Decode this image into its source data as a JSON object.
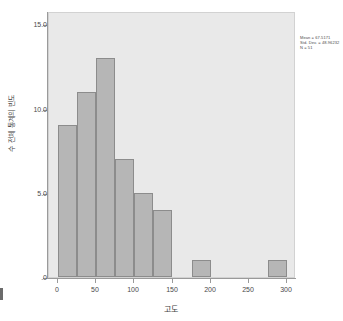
{
  "chart_data": {
    "type": "bar",
    "title": "",
    "subtitle": "",
    "xlabel": "고도",
    "ylabel": "수 전체 통계의 빈도",
    "xlim": [
      -12,
      312
    ],
    "ylim": [
      0,
      15.8
    ],
    "grid": false,
    "legend_position": "none",
    "bin_width": 25,
    "categories": [
      "0-25",
      "25-50",
      "50-75",
      "75-100",
      "100-125",
      "125-150",
      "150-175",
      "175-200",
      "200-225",
      "225-250",
      "250-275",
      "275-300"
    ],
    "bin_starts": [
      0,
      25,
      50,
      75,
      100,
      125,
      150,
      175,
      200,
      225,
      250,
      275
    ],
    "values": [
      9,
      11,
      13,
      7,
      5,
      4,
      0,
      1,
      0,
      0,
      0,
      1
    ],
    "xticks": [
      0,
      50,
      100,
      150,
      200,
      250,
      300
    ],
    "xtick_labels": [
      "0",
      "50",
      "100",
      "150",
      "200",
      "250",
      "300"
    ],
    "yticks": [
      0,
      5,
      10,
      15
    ],
    "ytick_labels": [
      ".0",
      "5.0",
      "10.0",
      "15.0"
    ],
    "annotations": [
      "Mean = 67.5171",
      "Std. Dev. = 48.96232",
      "N = 51"
    ],
    "colors": {
      "bar_fill": "#b6b6b6",
      "bar_border": "#8c8c8c",
      "plot_background": "#e9e9e9",
      "axis": "#9a9a9a",
      "text": "#4a4a4a",
      "page_background": "#ffffff"
    }
  },
  "stats": {
    "mean_label": "Mean = 67.5171",
    "std_dev_label": "Std. Dev. = 48.96232",
    "n_label": "N = 51"
  }
}
